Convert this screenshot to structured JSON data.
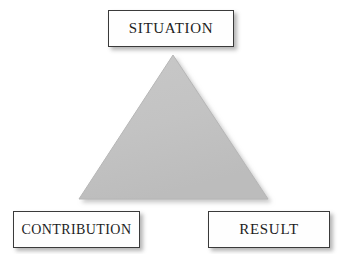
{
  "diagram": {
    "type": "triangle-framework",
    "title": "",
    "background_color": "#ffffff",
    "triangle": {
      "name": "star-triangle",
      "fill_color": "#c3c3c3",
      "edge_color": "#b4b4b4",
      "shadow_color": "#bdbdbd",
      "apex": {
        "x": 173,
        "y": 55
      },
      "base_left": {
        "x": 79,
        "y": 199
      },
      "base_right": {
        "x": 268,
        "y": 199
      }
    },
    "nodes": [
      {
        "id": "situation",
        "label": "SITUATION",
        "position": "apex",
        "box": {
          "x": 108,
          "y": 10,
          "width": 126,
          "height": 37
        },
        "border_color": "#3a3a3a",
        "fill_color": "#fefefe",
        "text_color": "#1d1d1d"
      },
      {
        "id": "contribution",
        "label": "CONTRIBUTION",
        "position": "bottom-left",
        "box": {
          "x": 13,
          "y": 211,
          "width": 127,
          "height": 37
        },
        "border_color": "#3a3a3a",
        "fill_color": "#fefefe",
        "text_color": "#1d1d1d"
      },
      {
        "id": "result",
        "label": "RESULT",
        "position": "bottom-right",
        "box": {
          "x": 208,
          "y": 211,
          "width": 122,
          "height": 37
        },
        "border_color": "#3a3a3a",
        "fill_color": "#fefefe",
        "text_color": "#1d1d1d"
      }
    ]
  }
}
